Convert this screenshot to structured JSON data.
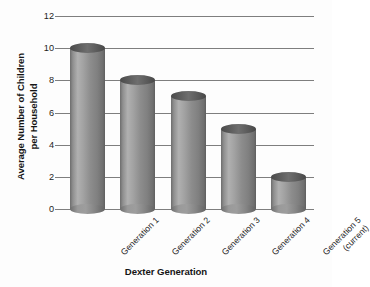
{
  "chart_data": {
    "type": "bar",
    "title": "",
    "xlabel": "Dexter Generation",
    "ylabel": "Average Number of Children\nper Household",
    "ylabel_line1": "Average Number of Children",
    "ylabel_line2": "per Household",
    "categories": [
      "Generation 1",
      "Generation 2",
      "Generation 3",
      "Generation 4",
      "Generation 5\n(current)"
    ],
    "values": [
      10,
      8,
      7,
      5,
      2
    ],
    "ylim": [
      0,
      12
    ],
    "yticks": [
      0,
      2,
      4,
      6,
      8,
      10,
      12
    ],
    "ytick_labels": [
      "0",
      "2",
      "4",
      "6",
      "8",
      "10",
      "12"
    ],
    "grid": true,
    "legend": false,
    "bar_style": "cylinder",
    "colors": {
      "bar_light": "#b0b0b0",
      "bar_mid": "#8d8d8d",
      "bar_dark": "#5f5f5f",
      "cap": "#5c5c5c",
      "gridline": "#7e7e7e",
      "text": "#1d1d1d",
      "background": "#fdfdfd"
    }
  },
  "axis": {
    "x_title": "Dexter Generation",
    "y_title_line1": "Average Number of Children",
    "y_title_line2": "per Household"
  }
}
